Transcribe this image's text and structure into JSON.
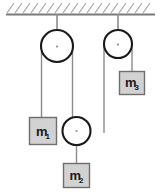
{
  "figure": {
    "width": 161,
    "height": 192,
    "background": "#ffffff"
  },
  "colors": {
    "ceiling_line": "#7a7a7a",
    "hatch_line": "#a0a0a0",
    "pulley_stroke": "#1a1a1a",
    "pulley_fill": "#ffffff",
    "string": "#8c8c8c",
    "block_fill": "#d2d2d2",
    "block_stroke": "#6e6e6e",
    "label_text": "#1a1a1a"
  },
  "ceiling": {
    "name": "ceiling",
    "y": 14,
    "x_start": 6,
    "x_end": 155,
    "hatch_count": 18,
    "hatch_length": 11,
    "hatch_lean": "right"
  },
  "pulleys": [
    {
      "id": "pulley-left",
      "type": "fixed",
      "cx": 57,
      "cy": 46,
      "r": 16,
      "support": {
        "from_y": 14,
        "to_y": 46
      }
    },
    {
      "id": "pulley-right",
      "type": "fixed",
      "cx": 118,
      "cy": 44,
      "r": 14,
      "support": {
        "from_y": 14,
        "to_y": 44
      }
    },
    {
      "id": "pulley-middle",
      "type": "movable",
      "cx": 76,
      "cy": 131,
      "r": 14,
      "support": {
        "from_y": 131,
        "to_y": 160
      }
    }
  ],
  "strings": [
    {
      "id": "string-left-pulley-left-side",
      "x": 41,
      "y1": 46,
      "y2": 117
    },
    {
      "id": "string-left-pulley-right-side",
      "x": 73,
      "y1": 46,
      "y2": 131
    },
    {
      "id": "string-right-pulley-left-side",
      "x": 104,
      "y1": 44,
      "y2": 131
    },
    {
      "id": "string-right-pulley-right-side",
      "x": 132,
      "y1": 44,
      "y2": 71
    },
    {
      "id": "string-middle-pulley-to-m2",
      "x": 76,
      "y1": 131,
      "y2": 163
    }
  ],
  "blocks": [
    {
      "id": "block-m1",
      "label": "m",
      "subscript": "1",
      "x": 29,
      "y": 117,
      "width": 28,
      "height": 28
    },
    {
      "id": "block-m2",
      "label": "m",
      "subscript": "2",
      "x": 63,
      "y": 163,
      "width": 27,
      "height": 25
    },
    {
      "id": "block-m3",
      "label": "m",
      "subscript": "3",
      "x": 119,
      "y": 71,
      "width": 26,
      "height": 24
    }
  ]
}
